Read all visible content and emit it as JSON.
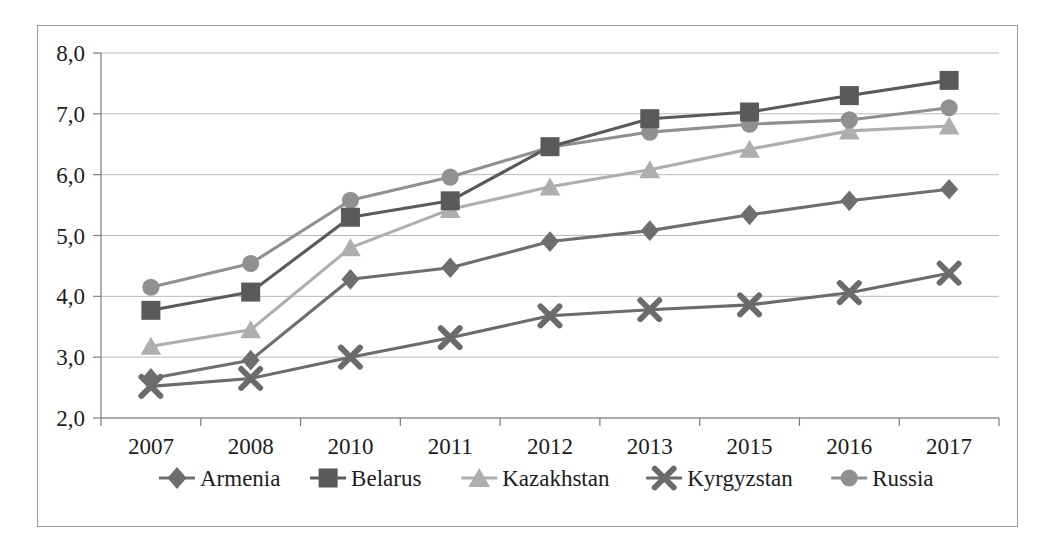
{
  "chart_data": {
    "type": "line",
    "title": "",
    "subtitle": "",
    "xlabel": "",
    "ylabel": "",
    "categories": [
      "2007",
      "2008",
      "2010",
      "2011",
      "2012",
      "2013",
      "2015",
      "2016",
      "2017"
    ],
    "ylim": [
      2.0,
      8.0
    ],
    "ytick_labels": [
      "2,0",
      "3,0",
      "4,0",
      "5,0",
      "6,0",
      "7,0",
      "8,0"
    ],
    "ytick_values": [
      2.0,
      3.0,
      4.0,
      5.0,
      6.0,
      7.0,
      8.0
    ],
    "grid": true,
    "grid_axis": "y",
    "legend_position": "bottom",
    "decimal_separator": ",",
    "series": [
      {
        "name": "Armenia",
        "marker": "diamond",
        "color": "#6e6e6e",
        "values": [
          2.65,
          2.95,
          4.28,
          4.47,
          4.9,
          5.08,
          5.34,
          5.57,
          5.76
        ]
      },
      {
        "name": "Belarus",
        "marker": "square",
        "color": "#5a5a5a",
        "values": [
          3.77,
          4.07,
          5.3,
          5.57,
          6.46,
          6.92,
          7.03,
          7.3,
          7.55
        ]
      },
      {
        "name": "Kazakhstan",
        "marker": "triangle",
        "color": "#aeaeae",
        "values": [
          3.18,
          3.45,
          4.8,
          5.43,
          5.8,
          6.08,
          6.42,
          6.72,
          6.8
        ]
      },
      {
        "name": "Kyrgyzstan",
        "marker": "x",
        "color": "#6b6b6b",
        "values": [
          2.52,
          2.65,
          3.0,
          3.32,
          3.68,
          3.78,
          3.86,
          4.06,
          4.38
        ]
      },
      {
        "name": "Russia",
        "marker": "circle",
        "color": "#909090",
        "values": [
          4.15,
          4.54,
          5.58,
          5.96,
          6.45,
          6.7,
          6.83,
          6.9,
          7.1
        ]
      }
    ]
  },
  "colors": {
    "frame": "#9a9a9a",
    "gridline": "#b9b9b9",
    "axis": "#7d7d7d",
    "text": "#1c1c1c",
    "background": "#ffffff"
  }
}
